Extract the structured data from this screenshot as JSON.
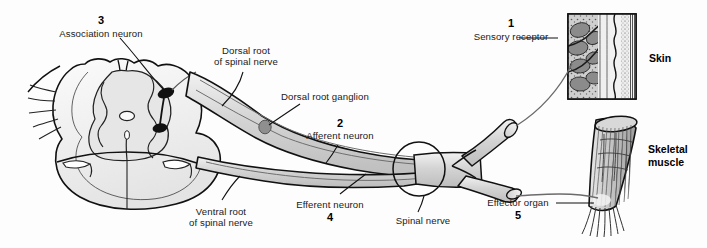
{
  "figure": {
    "background_color": "#fdfdfd",
    "ink_color": "#1a1a1a",
    "nerve_fill": "#d7d7d7",
    "cord_fill": "#ededed",
    "gray_matter_fill": "#e3e3e3"
  },
  "labels": {
    "association_neuron": {
      "number": "3",
      "text": "Association neuron"
    },
    "dorsal_root": {
      "line1": "Dorsal root",
      "line2": "of spinal nerve"
    },
    "dorsal_root_ganglion": {
      "text": "Dorsal root ganglion"
    },
    "afferent_neuron": {
      "number": "2",
      "text": "Afferent neuron"
    },
    "sensory_receptor": {
      "number": "1",
      "text": "Sensory receptor"
    },
    "skin": {
      "text": "Skin"
    },
    "skeletal_muscle": {
      "line1": "Skeletal",
      "line2": "muscle"
    },
    "ventral_root": {
      "line1": "Ventral root",
      "line2": "of spinal nerve"
    },
    "efferent_neuron": {
      "number": "4",
      "text": "Efferent neuron"
    },
    "spinal_nerve": {
      "text": "Spinal nerve"
    },
    "effector_organ": {
      "number": "5",
      "text": "Effector organ"
    }
  },
  "structures": {
    "spinal_cord": "spinal-cord-cross-section",
    "ganglion": "dorsal-root-ganglion-body",
    "cell_body_upper": "association-neuron-cell-body",
    "cell_body_lower": "efferent-neuron-cell-body",
    "skin_inset": "skin-histology-inset",
    "muscle": "skeletal-muscle-organ",
    "nerve_trunk": "spinal-nerve-trunk",
    "nerve_branch_upper": "sensory-branch-cut-end",
    "nerve_branch_lower": "motor-branch-cut-end",
    "spinal_nerve_circle": "spinal-nerve-callout-circle"
  }
}
